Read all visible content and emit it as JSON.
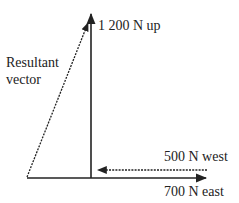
{
  "diagram": {
    "title": "",
    "colors": {
      "line": "#222222",
      "background": "#ffffff"
    },
    "vectors": [
      {
        "id": "up",
        "label": "1 200 N up",
        "magnitude_n": 1200,
        "direction": "up",
        "style": "solid"
      },
      {
        "id": "west",
        "label": "500 N west",
        "magnitude_n": 500,
        "direction": "west",
        "style": "dashed"
      },
      {
        "id": "east",
        "label": "700 N east",
        "magnitude_n": 700,
        "direction": "east",
        "style": "solid"
      },
      {
        "id": "resultant",
        "label": "Resultant vector",
        "label_lines": [
          "Resultant",
          "vector"
        ],
        "direction": "up-right",
        "style": "dashed"
      }
    ]
  }
}
